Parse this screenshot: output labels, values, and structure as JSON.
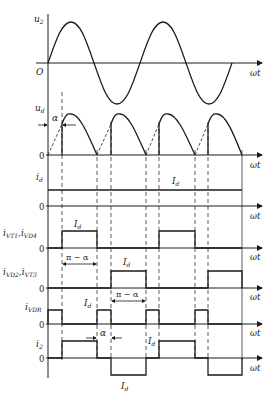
{
  "x_axis_label": "ωt",
  "origin_label": "O",
  "zero_label": "0",
  "panels": [
    {
      "id": "u2",
      "label": "u",
      "sub": "2",
      "description": "supply voltage sine wave"
    },
    {
      "id": "ud",
      "label": "u",
      "sub": "d",
      "description": "output voltage, chopped half-sines from firing angle α",
      "annotation": "α"
    },
    {
      "id": "id",
      "label": "i",
      "sub": "d",
      "description": "constant load current",
      "level_label": "I",
      "level_sub": "d"
    },
    {
      "id": "ivt1",
      "label": "i",
      "sub": "VT1",
      "label2": "i",
      "sub2": "VD4",
      "level_label": "I",
      "level_sub": "d",
      "annotation": "π − α"
    },
    {
      "id": "ivd2",
      "label": "i",
      "sub": "VD2",
      "label2": "i",
      "sub2": "VT3",
      "level_label": "I",
      "level_sub": "d",
      "annotation": "π − α"
    },
    {
      "id": "ivdr",
      "label": "i",
      "sub": "VDR",
      "level_label": "I",
      "level_sub": "d",
      "annotation": "α"
    },
    {
      "id": "i2",
      "label": "i",
      "sub": "2",
      "level_label": "I",
      "level_sub": "d",
      "neg_level_label": "I",
      "neg_level_sub": "d"
    }
  ],
  "labels": {
    "alpha": "α",
    "pi_minus_alpha": "π − α",
    "Id": "I",
    "Id_sub": "d"
  }
}
